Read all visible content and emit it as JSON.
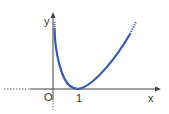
{
  "diagram": {
    "labels": {
      "y_axis": "y",
      "x_axis": "x",
      "origin": "O",
      "tick": "1"
    },
    "colors": {
      "curve": "#3a5aa8",
      "axis": "#444444"
    }
  }
}
